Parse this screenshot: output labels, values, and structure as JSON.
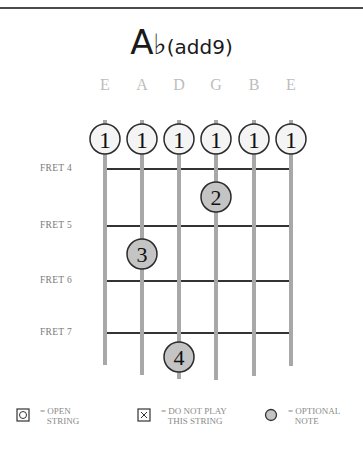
{
  "chord": {
    "root": "A",
    "accidental": "♭",
    "extension": "(add9)"
  },
  "strings": [
    {
      "name": "E",
      "x": 105,
      "bottom": 365
    },
    {
      "name": "A",
      "x": 142,
      "bottom": 375
    },
    {
      "name": "D",
      "x": 179,
      "bottom": 379
    },
    {
      "name": "G",
      "x": 216,
      "bottom": 380
    },
    {
      "name": "B",
      "x": 254,
      "bottom": 376
    },
    {
      "name": "E",
      "x": 291,
      "bottom": 366
    }
  ],
  "frets": [
    {
      "label": "FRET 4",
      "y": 169
    },
    {
      "label": "FRET 5",
      "y": 226
    },
    {
      "label": "FRET 6",
      "y": 281
    },
    {
      "label": "FRET 7",
      "y": 333
    }
  ],
  "barre": {
    "finger": "1",
    "strings": [
      1,
      2,
      3,
      4,
      5,
      6
    ]
  },
  "fingerings": [
    {
      "finger": "2",
      "string": 4,
      "fret": 4,
      "cx": 216,
      "cy": 197
    },
    {
      "finger": "3",
      "string": 2,
      "fret": 5,
      "cx": 142,
      "cy": 254
    },
    {
      "finger": "4",
      "string": 3,
      "fret": 7,
      "cx": 179,
      "cy": 357
    }
  ],
  "legend": {
    "open": {
      "line1": "= OPEN",
      "line2": "STRING"
    },
    "mute": {
      "line1": "= DO NOT PLAY",
      "line2": "THIS STRING"
    },
    "optional": {
      "line1": "= OPTIONAL",
      "line2": "NOTE"
    }
  },
  "colors": {
    "string": "#a8a8a8",
    "fret": "#333333",
    "dot_fill": "#c4c4c4",
    "open_circle_fill": "#f4f4f4",
    "outline": "#2a2a2a"
  }
}
